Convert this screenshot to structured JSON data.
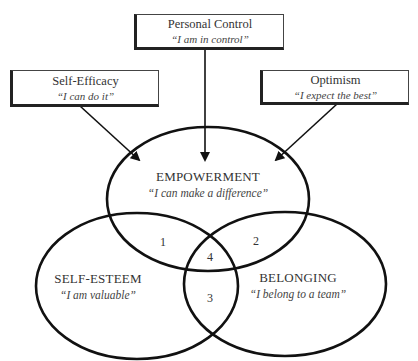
{
  "boxes": {
    "personal_control": {
      "title": "Personal Control",
      "quote": "“I am in control”"
    },
    "self_efficacy": {
      "title": "Self-Efficacy",
      "quote": "“I can do it”"
    },
    "optimism": {
      "title": "Optimism",
      "quote": "“I expect the best”"
    }
  },
  "circles": {
    "empowerment": {
      "title": "EMPOWERMENT",
      "quote": "“I can make a difference”"
    },
    "self_esteem": {
      "title": "SELF-ESTEEM",
      "quote": "“I am valuable”"
    },
    "belonging": {
      "title": "BELONGING",
      "quote": "“I belong to a team”"
    }
  },
  "regions": {
    "r1": "1",
    "r2": "2",
    "r3": "3",
    "r4": "4"
  },
  "colors": {
    "stroke": "#111111",
    "text": "#333333",
    "background": "#ffffff"
  }
}
